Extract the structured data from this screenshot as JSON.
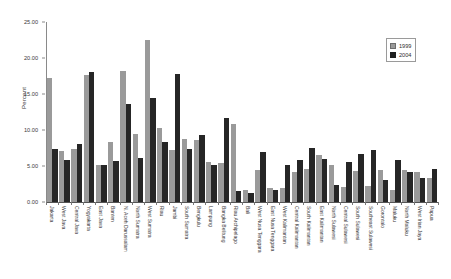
{
  "chart_data": {
    "type": "bar",
    "title": "",
    "xlabel": "",
    "ylabel": "Percent",
    "ylim": [
      0,
      25
    ],
    "yticks": [
      "0.00",
      "5.00",
      "10.00",
      "15.00",
      "20.00",
      "25.00"
    ],
    "ytick_values": [
      0,
      5,
      10,
      15,
      20,
      25
    ],
    "grid": false,
    "legend_position": "top-right",
    "categories": [
      "Jakarta",
      "West Java",
      "Central Java",
      "Yogyakarta",
      "East Java",
      "Banten",
      "N. Aceh Darussalam",
      "North Sumatra",
      "West Sumatra",
      "Riau",
      "Jambi",
      "South Sumatra",
      "Bengkulu",
      "Lampung",
      "Bangka Belitung",
      "Riau Archipelago",
      "Bali",
      "West Nusa Tenggara",
      "East Nusa Tenggara",
      "West Kalimantan",
      "Central Kalimantan",
      "South Kalimantan",
      "East Kalimantan",
      "North Sulawesi",
      "Central Sulawesi",
      "South Sulawesi",
      "Southeast Sulawesi",
      "Gorontalo",
      "Maluku",
      "North Maluku",
      "West Irian Jaya",
      "Papua"
    ],
    "series": [
      {
        "name": "1999",
        "color": "#9a9a9a",
        "values": [
          17.2,
          7.1,
          7.3,
          17.6,
          5.2,
          8.4,
          18.2,
          9.4,
          22.5,
          10.3,
          7.2,
          8.7,
          8.6,
          5.6,
          5.4,
          10.8,
          1.7,
          4.4,
          2.0,
          1.9,
          4.1,
          4.6,
          6.5,
          5.2,
          2.1,
          4.3,
          2.2,
          4.5,
          1.7,
          4.4,
          4.2,
          3.3
        ]
      },
      {
        "name": "2004",
        "color": "#262626",
        "values": [
          7.4,
          5.8,
          8.1,
          18.1,
          5.2,
          5.7,
          13.6,
          6.1,
          14.4,
          8.3,
          17.8,
          7.3,
          9.3,
          5.1,
          11.6,
          1.5,
          1.2,
          7.0,
          1.6,
          5.2,
          5.9,
          7.5,
          6.0,
          2.3,
          5.6,
          6.7,
          7.2,
          3.1,
          5.8,
          4.2,
          3.4,
          4.6
        ]
      }
    ]
  },
  "legend": {
    "entries": [
      {
        "label": "1999"
      },
      {
        "label": "2004"
      }
    ]
  }
}
